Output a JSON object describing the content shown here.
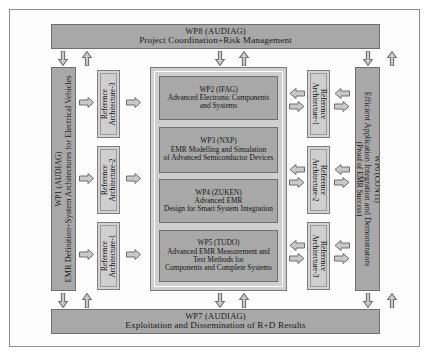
{
  "diagram": {
    "colors": {
      "wp_fill": "#a8a8a8",
      "ref_fill": "#d0d0d0",
      "core_fill": "#cfcfcf",
      "border": "#6f6f6f",
      "arrow_fill": "#c9c9c9",
      "background": "#fdfdfd"
    }
  },
  "top_bar": {
    "code": "WP8 (AUDIAG)",
    "description": "Project Coordination+Risk Management"
  },
  "bottom_bar": {
    "code": "WP7 (AUDIAG)",
    "description": "Exploitation and Dissemination of R+D Results"
  },
  "left_bar": {
    "code": "WP1 (AUDIAG)",
    "description": "EMR Definition+System Architectures for Electrical Vehicles"
  },
  "right_bar": {
    "code": "WP6 (CONTI)",
    "line2": "Efficient Application Integration and Demonstrators",
    "line3": "(Proof of EMR Success)"
  },
  "reference_left": [
    {
      "line1": "Reference",
      "line2": "Architecture-3"
    },
    {
      "line1": "Reference",
      "line2": "Architecture-2"
    },
    {
      "line1": "Reference",
      "line2": "Architecture-1"
    }
  ],
  "reference_right": [
    {
      "line1": "Reference",
      "line2": "Architecture-1"
    },
    {
      "line1": "Reference",
      "line2": "Architecture-2"
    },
    {
      "line1": "Reference",
      "line2": "Architecture-3"
    }
  ],
  "core_packages": [
    {
      "code": "WP2 (IFAG)",
      "line1": "Advanced Electronic Components",
      "line2": "and Systems"
    },
    {
      "code": "WP3 (NXP)",
      "line1": "EMR Modelling and Simulation",
      "line2": "of Advanced Semiconductor Devices"
    },
    {
      "code": "WP4 (ZUKEN)",
      "line1": "Advanced EMR",
      "line2": "Design for Smart System Integration"
    },
    {
      "code": "WP5 (TUDO)",
      "line1": "Advanced EMR Measurement and",
      "line2": "Test Methods for",
      "line3": "Components and Complete Systems"
    }
  ]
}
